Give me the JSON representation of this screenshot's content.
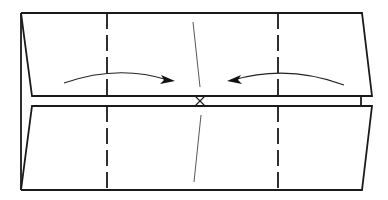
{
  "diagram": {
    "type": "origami-fold-instruction",
    "colors": {
      "line": "#1a1a1a",
      "background": "#ffffff"
    },
    "panels": [
      {
        "name": "top-flap",
        "outline": [
          [
            21,
            13
          ],
          [
            362,
            13
          ],
          [
            372,
            96
          ],
          [
            32,
            96
          ]
        ]
      },
      {
        "name": "bottom-flap",
        "outline": [
          [
            32,
            106
          ],
          [
            372,
            106
          ],
          [
            362,
            190
          ],
          [
            21,
            190
          ]
        ]
      }
    ],
    "valley_folds": [
      {
        "name": "left-fold-line",
        "x": 107
      },
      {
        "name": "right-fold-line",
        "x": 278
      }
    ],
    "center_creases": [
      {
        "name": "top-center-crease",
        "from": [
          193,
          22
        ],
        "to": [
          200,
          87
        ]
      },
      {
        "name": "bottom-center-crease",
        "from": [
          201,
          115
        ],
        "to": [
          194,
          182
        ]
      }
    ],
    "arrows": [
      {
        "name": "fold-left-to-center-arrow",
        "direction": "right"
      },
      {
        "name": "fold-right-to-center-arrow",
        "direction": "left"
      }
    ],
    "marks": [
      {
        "name": "center-x-mark",
        "symbol": "X",
        "at": [
          200,
          101
        ]
      }
    ]
  }
}
